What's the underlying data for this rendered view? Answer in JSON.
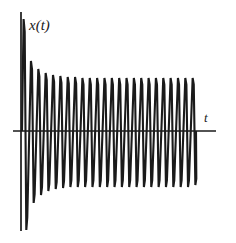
{
  "figure": {
    "title": "",
    "background_color": "#ffffff",
    "stroke_color": "#1a1a1a",
    "width": 236,
    "height": 243
  },
  "axes": {
    "y_axis": {
      "label": "x(t)",
      "name": "vertical-axis",
      "x_px": 21,
      "top_px": 12,
      "bottom_px": 231
    },
    "x_axis": {
      "label": "t",
      "name": "horizontal-axis",
      "y_px": 131,
      "left_px": 13,
      "right_px": 216
    }
  },
  "chart_data": {
    "type": "line",
    "title": "",
    "xlabel": "t",
    "ylabel": "x(t)",
    "grid": false,
    "legend": null,
    "waveform": {
      "cycles": 24,
      "period_px": 7.35,
      "start_x_px": 22,
      "end_x_px": 196,
      "baseline_y_px": 131,
      "initial_peak_amplitude_px": 112,
      "steady_peak_amplitude_px": 53,
      "decay_cycles": 4,
      "edge_slope_px": 1.6,
      "shoulder_fraction": 0.3,
      "line_width_px": 2.1
    },
    "envelope": {
      "comment": "Peak amplitude per cycle, pixels above/below the t-axis, index 0 = first cycle",
      "upper_amplitude": [
        112,
        70,
        62,
        58,
        56,
        55,
        54,
        54,
        53,
        53,
        53,
        53,
        53,
        53,
        53,
        53,
        53,
        53,
        53,
        53,
        53,
        53,
        53,
        53
      ],
      "lower_amplitude": [
        99,
        72,
        64,
        60,
        58,
        57,
        56,
        56,
        56,
        56,
        56,
        56,
        56,
        56,
        56,
        56,
        56,
        56,
        56,
        56,
        56,
        56,
        56,
        54
      ]
    }
  }
}
